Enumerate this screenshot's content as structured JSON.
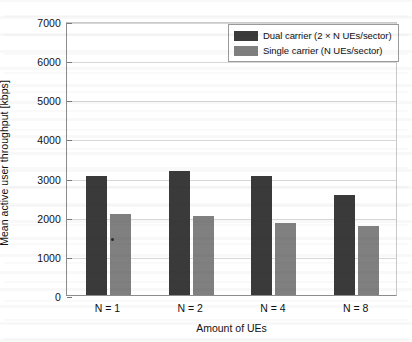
{
  "chart_data": {
    "type": "bar",
    "title": "",
    "xlabel": "Amount of UEs",
    "ylabel": "Mean active user throughput [kbps]",
    "categories": [
      "N = 1",
      "N = 2",
      "N = 4",
      "N = 8"
    ],
    "series": [
      {
        "name": "Dual carrier (2 × N UEs/sector)",
        "color": "#3a3a3a",
        "values": [
          3050,
          3180,
          3050,
          2560
        ]
      },
      {
        "name": "Single carrier (N UEs/sector)",
        "color": "#808080",
        "values": [
          2060,
          2020,
          1850,
          1770
        ]
      }
    ],
    "ylim": [
      0,
      7000
    ],
    "ytick_values": [
      0,
      1000,
      2000,
      3000,
      4000,
      5000,
      6000,
      7000
    ],
    "ytick_labels": [
      "0",
      "1000",
      "2000",
      "3000",
      "4000",
      "5000",
      "6000",
      "7000"
    ],
    "grid": true,
    "legend_position": "top-right",
    "background_color": "#ffffff",
    "axis_color": "#8c8c8c",
    "grid_color": "#d7d7d7"
  }
}
